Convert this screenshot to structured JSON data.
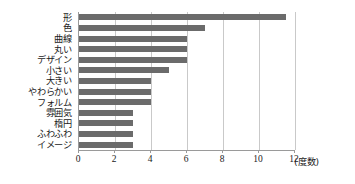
{
  "chart_data": {
    "type": "bar",
    "orientation": "horizontal",
    "title": "",
    "xlabel": "(度数)",
    "ylabel": "",
    "xlim": [
      0,
      12
    ],
    "xticks": [
      0,
      2,
      4,
      6,
      8,
      10,
      12
    ],
    "xtick_labels": [
      "0",
      "2",
      "4",
      "6",
      "8",
      "10",
      "12"
    ],
    "grid": true,
    "legend": false,
    "bar_color": "#6b6b6b",
    "axis_color": "#9a9a9a",
    "grid_color": "#c9c9c9",
    "categories": [
      "形",
      "色",
      "曲線",
      "丸い",
      "デザイン",
      "小さい",
      "大きい",
      "やわらかい",
      "フォルム",
      "雰囲気",
      "楕円",
      "ふわふわ",
      "イメージ"
    ],
    "values": [
      11.5,
      7,
      6,
      6,
      6,
      5,
      4,
      4,
      4,
      3,
      3,
      3,
      3
    ]
  }
}
